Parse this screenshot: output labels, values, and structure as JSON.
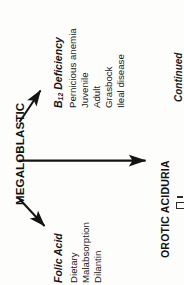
{
  "page": {
    "orientation": "rotated-90-ccw",
    "background_color": "#fdfdfc",
    "ink_color": "#1a1a1a"
  },
  "diagram": {
    "type": "flowchart",
    "root": {
      "label": "MEGALOBLASTIC",
      "style": "bold-caps"
    },
    "branches": [
      {
        "id": "b12",
        "label_prefix": "B",
        "label_subscript": "12",
        "label_suffix": "Deficiency",
        "label_full": "B12 Deficiency",
        "style": "bold-italic",
        "arrow": "diagonal-up",
        "items": [
          "Pernicious anemia",
          "Juvenile",
          "Adult",
          "Grasbock",
          "Ileal disease"
        ]
      },
      {
        "id": "orotic",
        "label_full": "OROTIC ACIDURIA",
        "style": "bold-caps",
        "arrow": "horizontal",
        "items": []
      },
      {
        "id": "folic",
        "label_full": "Folic Acid",
        "style": "bold-italic",
        "arrow": "diagonal-down",
        "items": [
          "Dietary",
          "Malabsorption",
          "Dilantin"
        ]
      }
    ],
    "footer_note": "Continued"
  }
}
